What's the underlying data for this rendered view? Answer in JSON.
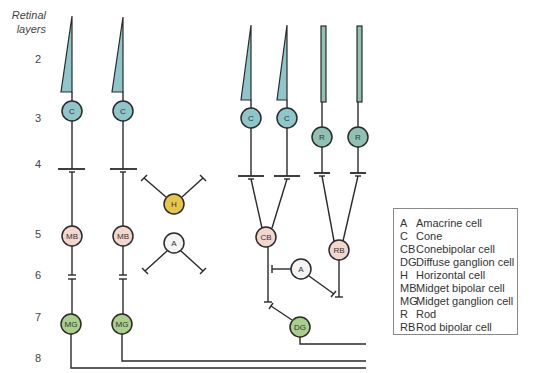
{
  "axis": {
    "title_line1": "Retinal",
    "title_line2": "layers",
    "layers": [
      {
        "label": "2",
        "y": 60
      },
      {
        "label": "3",
        "y": 119
      },
      {
        "label": "4",
        "y": 165
      },
      {
        "label": "5",
        "y": 235
      },
      {
        "label": "6",
        "y": 276
      },
      {
        "label": "7",
        "y": 318
      },
      {
        "label": "8",
        "y": 359
      }
    ]
  },
  "cells": {
    "cone1": "C",
    "cone2": "C",
    "cone3": "C",
    "cone4": "C",
    "rod1": "R",
    "rod2": "R",
    "horizontal": "H",
    "amacrine1": "A",
    "amacrine2": "A",
    "mb1": "MB",
    "mb2": "MB",
    "mg1": "MG",
    "mg2": "MG",
    "cb": "CB",
    "rb": "RB",
    "dg": "DG"
  },
  "colors": {
    "cone": "#8fc6c9",
    "rod": "#8fc2b4",
    "horizontal": "#e6c64a",
    "amacrine": "#f4f4f4",
    "bipolar": "#f3d6cc",
    "ganglion": "#a9cf8c",
    "stroke": "#2a2a2a"
  },
  "legend": {
    "items": [
      {
        "abbr": "A",
        "name": "Amacrine cell"
      },
      {
        "abbr": "C",
        "name": "Cone"
      },
      {
        "abbr": "CB",
        "name": "Conebipolar cell"
      },
      {
        "abbr": "DG",
        "name": "Diffuse ganglion cell"
      },
      {
        "abbr": "H",
        "name": "Horizontal cell"
      },
      {
        "abbr": "MB",
        "name": "Midget bipolar cell"
      },
      {
        "abbr": "MG",
        "name": "Midget ganglion cell"
      },
      {
        "abbr": "R",
        "name": "Rod"
      },
      {
        "abbr": "RB",
        "name": "Rod bipolar cell"
      }
    ]
  }
}
